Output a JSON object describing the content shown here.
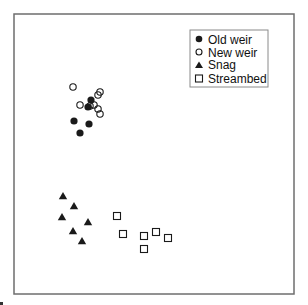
{
  "chart_data": {
    "type": "scatter",
    "title": "",
    "xlabel": "",
    "ylabel": "",
    "grid": false,
    "axes_ticks": false,
    "legend_position": "upper right (inside)",
    "coordinate_note": "Unlabeled ordination-style plot; coordinates are pixel positions within a 280x280 frame (origin top-left of frame).",
    "series": [
      {
        "name": "Old weir",
        "marker": "filled-circle",
        "points": [
          {
            "x": 77,
            "y": 86
          },
          {
            "x": 74,
            "y": 93
          },
          {
            "x": 60,
            "y": 107
          },
          {
            "x": 75,
            "y": 110
          },
          {
            "x": 66,
            "y": 119
          }
        ]
      },
      {
        "name": "New weir",
        "marker": "open-circle",
        "points": [
          {
            "x": 59,
            "y": 73
          },
          {
            "x": 86,
            "y": 78
          },
          {
            "x": 84,
            "y": 81
          },
          {
            "x": 66,
            "y": 91
          },
          {
            "x": 76,
            "y": 92
          },
          {
            "x": 80,
            "y": 91
          },
          {
            "x": 84,
            "y": 95
          },
          {
            "x": 86,
            "y": 100
          }
        ]
      },
      {
        "name": "Snag",
        "marker": "filled-triangle",
        "points": [
          {
            "x": 49,
            "y": 182
          },
          {
            "x": 60,
            "y": 192
          },
          {
            "x": 48,
            "y": 203
          },
          {
            "x": 74,
            "y": 208
          },
          {
            "x": 59,
            "y": 217
          },
          {
            "x": 68,
            "y": 227
          }
        ]
      },
      {
        "name": "Streambed",
        "marker": "open-square",
        "points": [
          {
            "x": 103,
            "y": 202
          },
          {
            "x": 109,
            "y": 220
          },
          {
            "x": 130,
            "y": 222
          },
          {
            "x": 142,
            "y": 218
          },
          {
            "x": 154,
            "y": 224
          },
          {
            "x": 130,
            "y": 235
          }
        ]
      }
    ]
  },
  "legend": {
    "items": [
      {
        "label": "Old weir",
        "marker": "filled-circle"
      },
      {
        "label": "New weir",
        "marker": "open-circle"
      },
      {
        "label": "Snag",
        "marker": "filled-triangle"
      },
      {
        "label": "Streambed",
        "marker": "open-square"
      }
    ]
  },
  "colors": {
    "frame": "#6e6e6e",
    "marker": "#1a1a1a",
    "background": "#ffffff"
  }
}
